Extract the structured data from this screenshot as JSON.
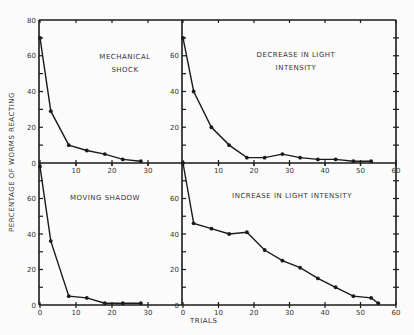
{
  "chart_data": [
    {
      "type": "line",
      "title": "MECHANICAL SHOCK",
      "xlabel": "TRIALS",
      "ylabel": "PERCENTAGE OF WORMS REACTING",
      "xlim": [
        0,
        30
      ],
      "ylim": [
        0,
        80
      ],
      "x_ticks": [
        0,
        10,
        20,
        30
      ],
      "y_ticks": [
        0,
        20,
        40,
        60,
        80
      ],
      "x": [
        0,
        3,
        8,
        13,
        18,
        23,
        28
      ],
      "values": [
        70,
        29,
        10,
        7,
        5,
        2,
        1
      ]
    },
    {
      "type": "line",
      "title": "DECREASE IN LIGHT INTENSITY",
      "xlabel": "TRIALS",
      "ylabel": "PERCENTAGE OF WORMS REACTING",
      "xlim": [
        0,
        60
      ],
      "ylim": [
        0,
        80
      ],
      "x_ticks": [
        0,
        10,
        20,
        30,
        40,
        50,
        60
      ],
      "y_ticks": [
        0,
        20,
        40,
        60
      ],
      "x": [
        0,
        3,
        8,
        13,
        18,
        23,
        28,
        33,
        38,
        43,
        48,
        53
      ],
      "values": [
        70,
        40,
        20,
        10,
        3,
        3,
        5,
        3,
        2,
        2,
        1,
        1
      ]
    },
    {
      "type": "line",
      "title": "MOVING SHADOW",
      "xlabel": "TRIALS",
      "ylabel": "PERCENTAGE OF WORMS REACTING",
      "xlim": [
        0,
        30
      ],
      "ylim": [
        0,
        80
      ],
      "x_ticks": [
        0,
        10,
        20,
        30
      ],
      "y_ticks": [
        0,
        20,
        40,
        60
      ],
      "x": [
        0,
        3,
        8,
        13,
        18,
        23,
        28
      ],
      "values": [
        78,
        36,
        5,
        4,
        1,
        1,
        1
      ]
    },
    {
      "type": "line",
      "title": "INCREASE IN LIGHT INTENSITY",
      "xlabel": "TRIALS",
      "ylabel": "PERCENTAGE OF WORMS REACTING",
      "xlim": [
        0,
        60
      ],
      "ylim": [
        0,
        80
      ],
      "x_ticks": [
        0,
        10,
        20,
        30,
        40,
        50,
        60
      ],
      "y_ticks": [
        0,
        20,
        40,
        60
      ],
      "x": [
        0,
        3,
        8,
        13,
        18,
        23,
        28,
        33,
        38,
        43,
        48,
        53,
        55
      ],
      "values": [
        80,
        46,
        43,
        40,
        41,
        31,
        25,
        21,
        15,
        10,
        5,
        4,
        1
      ]
    }
  ],
  "labels": {
    "ylabel": "PERCENTAGE OF WORMS REACTING",
    "xlabel": "TRIALS",
    "p1_line1": "MECHANICAL",
    "p1_line2": "SHOCK",
    "p2_line1": "DECREASE IN LIGHT",
    "p2_line2": "INTENSITY",
    "p3_line1": "MOVING SHADOW",
    "p4_line1": "INCREASE IN LIGHT INTENSITY"
  }
}
